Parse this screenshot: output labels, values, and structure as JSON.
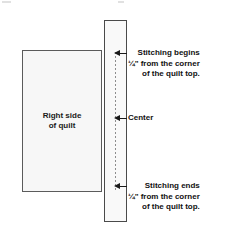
{
  "figure": {
    "background_color": "#ffffff",
    "outline_color": "#5b5b5b",
    "fill_color": "#f7f7f7",
    "stitch_line_color": "#8d8d8d",
    "text_color": "#111111"
  },
  "quilt": {
    "label": "Right side\nof quilt"
  },
  "border_strip": {
    "label": ""
  },
  "annotations": {
    "stitching_begins": {
      "text": "Stitching begins\n¼\" from the corner\nof the quilt top."
    },
    "center": {
      "text": "Center"
    },
    "stitching_ends": {
      "text": "Stitching ends\n¼\" from the corner\nof the quilt top."
    }
  }
}
